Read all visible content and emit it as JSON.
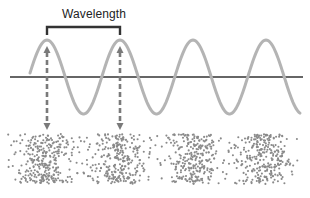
{
  "diagram": {
    "wavelength_label": "Wavelength",
    "caption": "",
    "colors": {
      "wave": "#b4b4b4",
      "axis": "#333333",
      "bracket": "#333333",
      "arrow": "#7a7a7a",
      "particle": "#8a8a8a"
    },
    "wave": {
      "axis_y": 77,
      "amplitude": 37,
      "period": 73,
      "first_peak_x": 47,
      "x_start": 30,
      "x_end": 300,
      "axis_x_start": 10,
      "axis_x_end": 303
    },
    "bracket": {
      "x1": 47,
      "x2": 120,
      "y": 27,
      "tick": 8
    },
    "arrows": [
      {
        "x": 47,
        "y_top": 46,
        "y_bottom": 130
      },
      {
        "x": 120,
        "y_top": 46,
        "y_bottom": 130
      }
    ],
    "particles": {
      "x_min": 8,
      "x_max": 298,
      "y_min": 134,
      "y_max": 184,
      "compression_centers": [
        47,
        120,
        193,
        266
      ]
    }
  }
}
